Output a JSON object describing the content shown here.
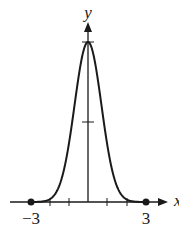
{
  "chart_data": {
    "type": "line",
    "title": "",
    "xlabel": "x",
    "ylabel": "y",
    "x_tick_labels": [
      "-3",
      "3"
    ],
    "x_ticks": [
      -3,
      -2,
      -1,
      0,
      1,
      2,
      3
    ],
    "y_ticks": [
      0.5,
      1
    ],
    "xlim": [
      -3.5,
      3.8
    ],
    "ylim": [
      0,
      1.2
    ],
    "grid": false,
    "legend": null,
    "series": [
      {
        "name": "bell curve",
        "function": "y = e^(-x^2)",
        "x": [
          -3,
          -2.5,
          -2,
          -1.5,
          -1,
          -0.5,
          0,
          0.5,
          1,
          1.5,
          2,
          2.5,
          3
        ],
        "values": [
          0.0001,
          0.002,
          0.018,
          0.105,
          0.368,
          0.779,
          1,
          0.779,
          0.368,
          0.105,
          0.018,
          0.002,
          0.0001
        ]
      }
    ],
    "points": [
      {
        "x": -3,
        "y": 0,
        "style": "filled-dot"
      },
      {
        "x": 3,
        "y": 0,
        "style": "filled-dot"
      }
    ]
  },
  "labels": {
    "y_axis": "y",
    "x_axis": "x",
    "neg3": "−3",
    "pos3": "3"
  }
}
